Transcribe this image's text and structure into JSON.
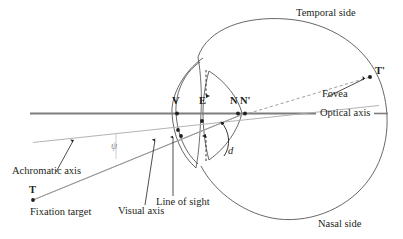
{
  "figure": {
    "background_color": "#ffffff",
    "ink_color": "#231f20",
    "outline_color": "#4d4d4d",
    "axis_color": "#808080",
    "ray_color": "#8c8c8c",
    "faint_color": "#b3b3b3"
  },
  "regions": {
    "temporal": "Temporal side",
    "nasal": "Nasal side"
  },
  "axes": {
    "optical": "Optical axis",
    "achromatic": "Achromatic axis",
    "visual": "Visual axis",
    "line_of_sight": "Line of sight"
  },
  "points": {
    "vertex": "V",
    "entrance_pupil": "E",
    "nodal_first": "N",
    "nodal_second": "N'",
    "target": "T",
    "target_image": "T'"
  },
  "parts": {
    "fovea": "Fovea",
    "fixation_target": "Fixation target"
  },
  "measures": {
    "pupil_diameter": "d",
    "angle_psi": "ψ"
  },
  "icons": {
    "arrow_up": "pupil-upper-arrow-icon",
    "arrow_down": "pupil-lower-arrow-icon",
    "curved_arrow": "pupil-diameter-arrow-icon",
    "leader_arrow": "leader-arrow-icon"
  }
}
